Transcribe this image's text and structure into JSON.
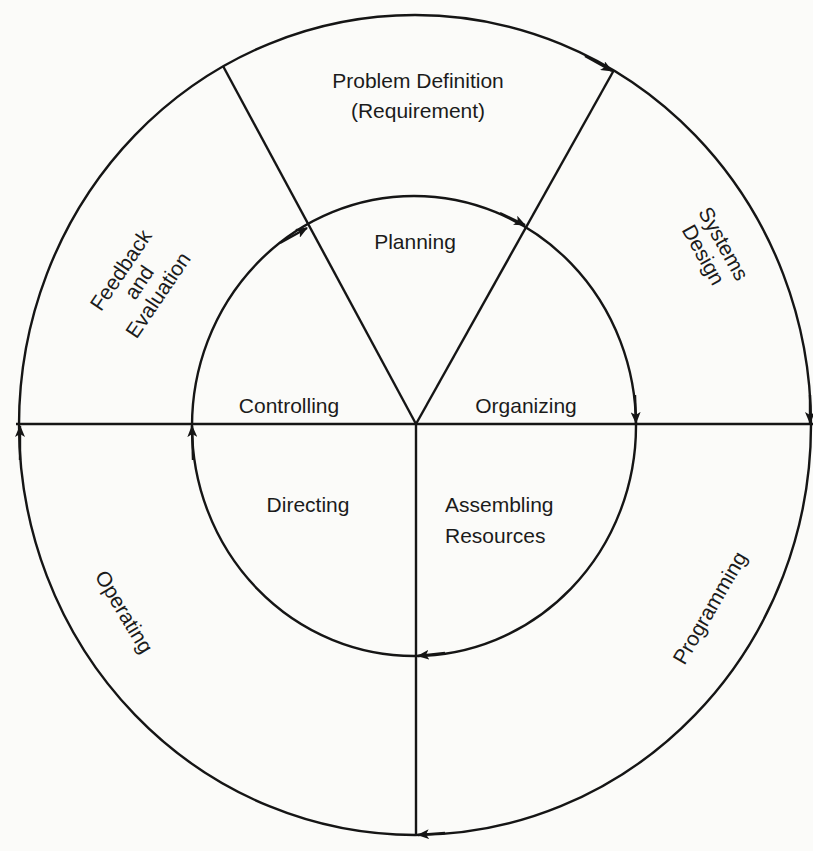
{
  "diagram": {
    "type": "cyclic-process",
    "direction": "clockwise",
    "colors": {
      "ink": "#151515",
      "background": "#fbfbf9"
    },
    "outer_ring": {
      "label": "System development cycle",
      "stages": [
        {
          "id": "problem-definition",
          "line1": "Problem Definition",
          "line2": "(Requirement)"
        },
        {
          "id": "systems-design",
          "line1": "Systems",
          "line2": "Design"
        },
        {
          "id": "programming",
          "line1": "Programming"
        },
        {
          "id": "operating",
          "line1": "Operating"
        },
        {
          "id": "feedback-evaluation",
          "line1": "Feedback",
          "line2": "and",
          "line3": "Evaluation"
        }
      ]
    },
    "inner_ring": {
      "label": "Management functions",
      "stages": [
        {
          "id": "planning",
          "line1": "Planning"
        },
        {
          "id": "organizing",
          "line1": "Organizing"
        },
        {
          "id": "assembling-resources",
          "line1": "Assembling",
          "line2": "Resources"
        },
        {
          "id": "directing",
          "line1": "Directing"
        },
        {
          "id": "controlling",
          "line1": "Controlling"
        }
      ]
    }
  }
}
